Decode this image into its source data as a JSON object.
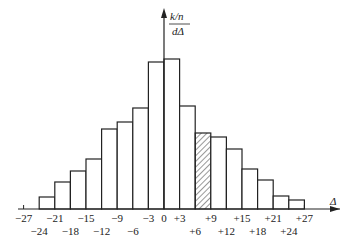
{
  "chart_data": {
    "type": "bar",
    "title": "",
    "xlabel": "Δ",
    "ylabel": "k/n / dΔ",
    "ylabel_parts": {
      "numerator": "k/n",
      "denominator": "dΔ"
    },
    "bin_width": 3,
    "bin_edges": [
      -24,
      -21,
      -18,
      -15,
      -12,
      -9,
      -6,
      -3,
      0,
      3,
      6,
      9,
      12,
      15,
      18,
      21,
      24,
      27
    ],
    "categories": [
      "-24~-21",
      "-21~-18",
      "-18~-15",
      "-15~-12",
      "-12~-9",
      "-9~-6",
      "-6~-3",
      "-3~0",
      "0~+3",
      "+3~+6",
      "+6~+9",
      "+9~+12",
      "+12~+15",
      "+15~+18",
      "+18~+21",
      "+21~+24",
      "+24~+27"
    ],
    "values": [
      12,
      27,
      38,
      50,
      80,
      87,
      101,
      147,
      150,
      103,
      76,
      72,
      60,
      40,
      29,
      13,
      9
    ],
    "value_units": "relative height (arbitrary, px at 150 = max)",
    "highlighted_bin": {
      "index": 10,
      "range": "+6~+9",
      "style": "hatched"
    },
    "x_tick_labels_upper": [
      "−27",
      "−21",
      "−15",
      "−9",
      "−3",
      "0",
      "+3",
      "+9",
      "+15",
      "+21",
      "+27"
    ],
    "x_tick_labels_lower": [
      "−24",
      "−18",
      "−12",
      "−6",
      "+6",
      "+12",
      "+18",
      "+24"
    ],
    "x_ticks": [
      -27,
      -24,
      -21,
      -18,
      -15,
      -12,
      -9,
      -6,
      -3,
      0,
      3,
      6,
      9,
      12,
      15,
      18,
      21,
      24,
      27
    ],
    "xlim": [
      -29,
      33
    ],
    "grid": false,
    "legend": null
  },
  "axes": {
    "x_label": "Δ",
    "y_label_numerator": "k/n",
    "y_label_denominator": "dΔ"
  }
}
